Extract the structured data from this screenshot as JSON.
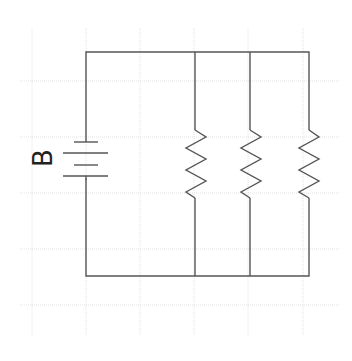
{
  "diagram": {
    "type": "circuit-schematic",
    "battery_label": "B",
    "components": [
      {
        "kind": "battery",
        "label": "B"
      },
      {
        "kind": "resistor",
        "index": 1
      },
      {
        "kind": "resistor",
        "index": 2
      },
      {
        "kind": "resistor",
        "index": 3
      }
    ],
    "colors": {
      "wire": "#555555",
      "grid": "#e2e2e2",
      "background": "#ffffff"
    }
  }
}
